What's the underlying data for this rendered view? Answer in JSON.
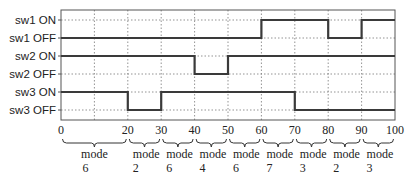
{
  "chart_data": {
    "type": "line",
    "title": "",
    "xlabel": "",
    "ylabel": "",
    "xlim": [
      0,
      100
    ],
    "x_ticks": [
      0,
      10,
      20,
      30,
      40,
      50,
      60,
      70,
      80,
      90,
      100
    ],
    "x_tick_labels": [
      "0",
      "",
      "20",
      "30",
      "40",
      "50",
      "60",
      "70",
      "80",
      "90",
      "100"
    ],
    "grid": true,
    "y_levels": [
      "sw1 ON",
      "sw1 OFF",
      "sw2 ON",
      "sw2 OFF",
      "sw3 ON",
      "sw3 OFF"
    ],
    "series": [
      {
        "name": "sw1",
        "on_label": "sw1 ON",
        "off_label": "sw1 OFF",
        "steps": [
          {
            "from": 0,
            "to": 60,
            "state": "OFF"
          },
          {
            "from": 60,
            "to": 80,
            "state": "ON"
          },
          {
            "from": 80,
            "to": 90,
            "state": "OFF"
          },
          {
            "from": 90,
            "to": 100,
            "state": "ON"
          }
        ]
      },
      {
        "name": "sw2",
        "on_label": "sw2 ON",
        "off_label": "sw2 OFF",
        "steps": [
          {
            "from": 0,
            "to": 40,
            "state": "ON"
          },
          {
            "from": 40,
            "to": 50,
            "state": "OFF"
          },
          {
            "from": 50,
            "to": 100,
            "state": "ON"
          }
        ]
      },
      {
        "name": "sw3",
        "on_label": "sw3 ON",
        "off_label": "sw3 OFF",
        "steps": [
          {
            "from": 0,
            "to": 20,
            "state": "ON"
          },
          {
            "from": 20,
            "to": 30,
            "state": "OFF"
          },
          {
            "from": 30,
            "to": 70,
            "state": "ON"
          },
          {
            "from": 70,
            "to": 100,
            "state": "OFF"
          }
        ]
      }
    ],
    "modes": [
      {
        "from": 0,
        "to": 20,
        "word": "mode",
        "number": "6"
      },
      {
        "from": 20,
        "to": 30,
        "word": "mode",
        "number": "2"
      },
      {
        "from": 30,
        "to": 40,
        "word": "mode",
        "number": "6"
      },
      {
        "from": 40,
        "to": 50,
        "word": "mode",
        "number": "4"
      },
      {
        "from": 50,
        "to": 60,
        "word": "mode",
        "number": "6"
      },
      {
        "from": 60,
        "to": 70,
        "word": "mode",
        "number": "7"
      },
      {
        "from": 70,
        "to": 80,
        "word": "mode",
        "number": "3"
      },
      {
        "from": 80,
        "to": 90,
        "word": "mode",
        "number": "2"
      },
      {
        "from": 90,
        "to": 100,
        "word": "mode",
        "number": "3"
      }
    ]
  }
}
